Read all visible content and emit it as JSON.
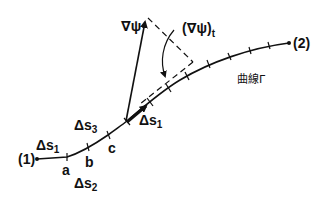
{
  "diagram": {
    "curve_label": "曲線Γ",
    "endpoints": [
      {
        "id": "start",
        "label": "(1)"
      },
      {
        "id": "end",
        "label": "(2)"
      }
    ],
    "points": [
      {
        "id": "a",
        "label": "a"
      },
      {
        "id": "b",
        "label": "b"
      },
      {
        "id": "c",
        "label": "c"
      }
    ],
    "segments": [
      {
        "id": "ds1_left",
        "label": "Δs",
        "subscript": "1"
      },
      {
        "id": "ds2",
        "label": "Δs",
        "subscript": "2"
      },
      {
        "id": "ds3",
        "label": "Δs",
        "subscript": "3"
      },
      {
        "id": "ds1_vector",
        "label": "Δs",
        "subscript": "1"
      }
    ],
    "vectors": {
      "gradient": {
        "label": "∇ψ"
      },
      "tangential": {
        "label": "(∇ψ)",
        "subscript": "t"
      }
    },
    "colors": {
      "ink": "#111111",
      "background": "#ffffff"
    }
  }
}
